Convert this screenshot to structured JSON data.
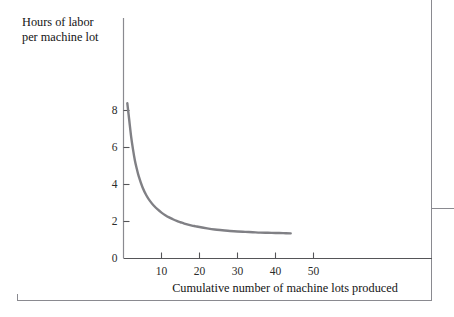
{
  "figure": {
    "background_color": "#ffffff",
    "frame_color": "#8a8a90"
  },
  "axis_titles": {
    "y_line_1": "Hours of  labor",
    "y_line_2": "per machine lot",
    "x": "Cumulative number of machine lots produced"
  },
  "chart_data": {
    "type": "line",
    "title": "",
    "subtitle": "",
    "xlabel": "Cumulative number of machine lots produced",
    "ylabel": "Hours of labor per machine lot",
    "xlim": [
      0,
      58
    ],
    "ylim": [
      0,
      9
    ],
    "xticks": [
      10,
      20,
      30,
      40,
      50
    ],
    "xtick_labels": [
      "10",
      "20",
      "30",
      "40",
      "50"
    ],
    "yticks": [
      0,
      2,
      4,
      6,
      8
    ],
    "ytick_labels": [
      "0",
      "2",
      "4",
      "6",
      "8"
    ],
    "grid": false,
    "legend": false,
    "legend_position": "none",
    "annotations": [],
    "series": [
      {
        "name": "Learning curve",
        "color": "#808085",
        "line_width": 2.4,
        "x": [
          1,
          1.5,
          2,
          2.5,
          3,
          3.5,
          4,
          5,
          6,
          7,
          8,
          9,
          10,
          11,
          12,
          13,
          14,
          15,
          16,
          17,
          18,
          19,
          20,
          22,
          24,
          26,
          28,
          30,
          32,
          34,
          36,
          38,
          40,
          42,
          44
        ],
        "y": [
          8.4,
          7.5,
          6.6,
          5.9,
          5.3,
          4.85,
          4.45,
          3.85,
          3.42,
          3.1,
          2.85,
          2.65,
          2.48,
          2.34,
          2.22,
          2.12,
          2.03,
          1.96,
          1.89,
          1.83,
          1.78,
          1.74,
          1.7,
          1.63,
          1.57,
          1.53,
          1.49,
          1.46,
          1.44,
          1.42,
          1.4,
          1.39,
          1.38,
          1.37,
          1.36
        ]
      }
    ]
  }
}
